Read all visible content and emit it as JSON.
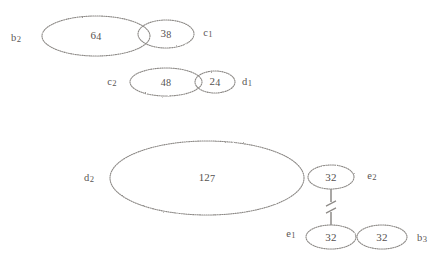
{
  "diagram": {
    "kind": "ellipse-chain-diagram",
    "background_color": "#ffffff",
    "stroke_color": "#8d8a87",
    "text_color": "#55514f",
    "nodes": [
      {
        "id": "n-64",
        "value": "64",
        "cx": 96,
        "cy": 36,
        "rx": 54,
        "ry": 20
      },
      {
        "id": "n-38",
        "value": "38",
        "cx": 166,
        "cy": 34,
        "rx": 28,
        "ry": 14
      },
      {
        "id": "n-48",
        "value": "48",
        "cx": 166,
        "cy": 82,
        "rx": 36,
        "ry": 14
      },
      {
        "id": "n-24",
        "value": "24",
        "cx": 215,
        "cy": 82,
        "rx": 20,
        "ry": 11
      },
      {
        "id": "n-127",
        "value": "127",
        "cx": 207,
        "cy": 178,
        "rx": 97,
        "ry": 37
      },
      {
        "id": "n-32a",
        "value": "32",
        "cx": 331,
        "cy": 177,
        "rx": 23,
        "ry": 12
      },
      {
        "id": "n-32b",
        "value": "32",
        "cx": 331,
        "cy": 237,
        "rx": 25,
        "ry": 12
      },
      {
        "id": "n-32c",
        "value": "32",
        "cx": 382,
        "cy": 237,
        "rx": 25,
        "ry": 12
      }
    ],
    "side_labels": [
      {
        "id": "lbl-b2",
        "text": "b2",
        "base": "b",
        "sub": "2",
        "x": 16,
        "y": 38
      },
      {
        "id": "lbl-c1",
        "text": "c1",
        "base": "c",
        "sub": "1",
        "x": 208,
        "y": 33
      },
      {
        "id": "lbl-c2",
        "text": "c2",
        "base": "c",
        "sub": "2",
        "x": 112,
        "y": 82
      },
      {
        "id": "lbl-d1",
        "text": "d1",
        "base": "d",
        "sub": "1",
        "x": 247,
        "y": 82
      },
      {
        "id": "lbl-d2",
        "text": "d2",
        "base": "d",
        "sub": "2",
        "x": 89,
        "y": 178
      },
      {
        "id": "lbl-e2",
        "text": "e2",
        "base": "e",
        "sub": "2",
        "x": 372,
        "y": 176
      },
      {
        "id": "lbl-e1",
        "text": "e1",
        "base": "e",
        "sub": "1",
        "x": 291,
        "y": 234
      },
      {
        "id": "lbl-b3",
        "text": "b3",
        "base": "b",
        "sub": "3",
        "x": 422,
        "y": 238
      }
    ],
    "connectors": [
      {
        "id": "conn-38-48",
        "from": "n-38",
        "to": "n-48",
        "x1": 166,
        "y1": 48,
        "x2": 166,
        "y2": 68,
        "broken": false
      },
      {
        "id": "conn-24-127",
        "from": "n-24",
        "to": "n-127",
        "x1": 215,
        "y1": 93,
        "x2": 215,
        "y2": 142,
        "broken": false
      },
      {
        "id": "conn-32a-32b",
        "from": "n-32a",
        "to": "n-32b",
        "x1": 331,
        "y1": 189,
        "x2": 331,
        "y2": 225,
        "broken": true
      }
    ]
  }
}
